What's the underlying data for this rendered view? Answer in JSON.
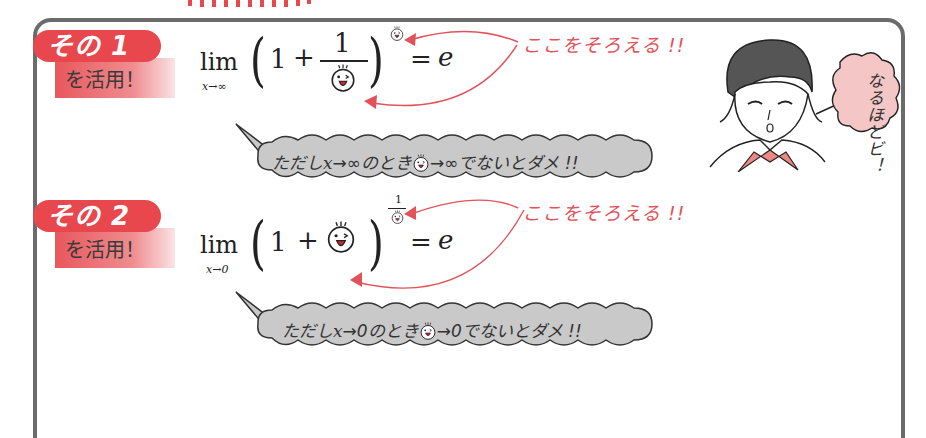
{
  "section1": {
    "badge_label": "その 1",
    "badge_sub": "を活用！",
    "formula": {
      "lim": "lim",
      "lim_sub": "x→∞",
      "one": "1",
      "plus": "+",
      "frac_num": "1",
      "equals": "=",
      "e": "e"
    },
    "note": "ここをそろえる !!",
    "condition": {
      "prefix": "ただし",
      "var": "x",
      "arrow_to": "→∞",
      "middle": "のとき",
      "face_to": "→∞",
      "suffix": "でないとダメ !!"
    }
  },
  "section2": {
    "badge_label": "その 2",
    "badge_sub": "を活用！",
    "formula": {
      "lim": "lim",
      "lim_sub": "x→0",
      "one": "1",
      "plus": "+",
      "exp_num": "1",
      "equals": "=",
      "e": "e"
    },
    "note": "ここをそろえる !!",
    "condition": {
      "prefix": "ただし",
      "var": "x",
      "arrow_to": "→0",
      "middle": "のとき",
      "face_to": "→0",
      "suffix": "でないとダメ !!"
    }
  },
  "character": {
    "thought": "なるほどビ！"
  },
  "colors": {
    "accent_red": "#e8474e",
    "note_red": "#e2525a",
    "frame_gray": "#6b6b6b",
    "bubble_gray": "#c9c9c9",
    "thought_pink": "#f4c7c6",
    "scarf_pink": "#eb8886"
  }
}
